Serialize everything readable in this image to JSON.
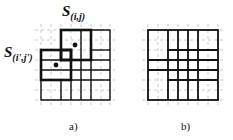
{
  "figure": {
    "panels": [
      {
        "id": "a",
        "caption": "a)",
        "labels": [
          {
            "base": "S",
            "sub": "(i,j)"
          },
          {
            "base": "S",
            "sub": "(i',j')"
          }
        ],
        "grid": {
          "x0": 41,
          "y0": 30,
          "cell": 10,
          "cols": 7,
          "rows": 7
        },
        "points": [
          [
            75,
            45
          ],
          [
            56,
            65
          ]
        ]
      },
      {
        "id": "b",
        "caption": "b)",
        "grid": {
          "x0": 148,
          "y0": 30,
          "cell": 10,
          "cols": 7,
          "rows": 7
        }
      }
    ],
    "colors": {
      "line": "#111111",
      "dash": "#9a9a9a",
      "background": "#ffffff"
    }
  }
}
